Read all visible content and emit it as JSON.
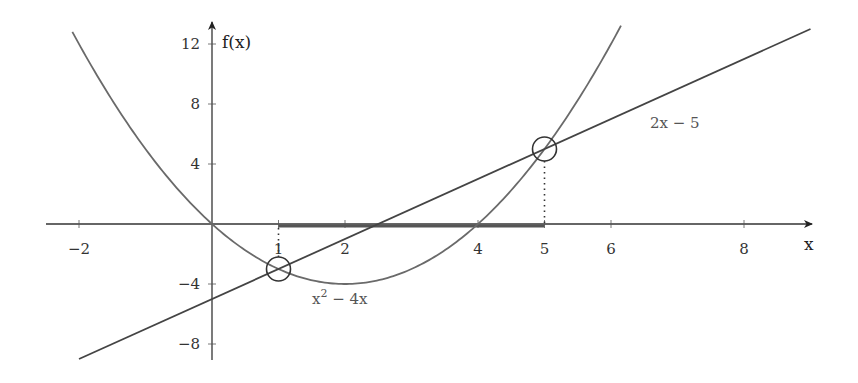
{
  "chart_data": {
    "type": "line",
    "title": "",
    "xlabel": "x",
    "ylabel": "f(x)",
    "xlim": [
      -2.5,
      9.0
    ],
    "ylim": [
      -9,
      13
    ],
    "grid": false,
    "x_ticks": [
      -2,
      1,
      2,
      4,
      5,
      6,
      8
    ],
    "x_tick_labels": [
      "−2",
      "1",
      "2",
      "4",
      "5",
      "6",
      "8"
    ],
    "y_ticks": [
      12,
      8,
      4,
      -4,
      -8
    ],
    "y_tick_labels": [
      "12",
      "8",
      "4",
      "−4",
      "−8"
    ],
    "series": [
      {
        "name": "x² − 4x",
        "label_parts": {
          "base": "x",
          "sup": "2",
          "rest": " − 4x"
        },
        "expression": "x^2 - 4x",
        "x_range": [
          -2.1,
          6.15
        ],
        "color": "#6a6a6a"
      },
      {
        "name": "2x − 5",
        "expression": "2x - 5",
        "x_range": [
          -2.0,
          9.0
        ],
        "color": "#444444"
      }
    ],
    "intersections": [
      {
        "x": 1,
        "y": -3
      },
      {
        "x": 5,
        "y": 5
      }
    ],
    "highlighted_interval": {
      "from": 1,
      "to": 5,
      "note": "solution interval on x-axis where x² − 4x < 2x − 5"
    },
    "annotations": [
      {
        "text": "x² − 4x",
        "near": [
          1.5,
          -5.5
        ]
      },
      {
        "text": "2x − 5",
        "near": [
          6.5,
          6.6
        ]
      }
    ]
  }
}
